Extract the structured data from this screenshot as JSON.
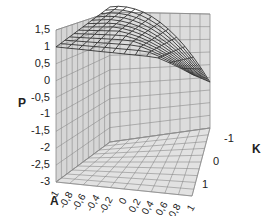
{
  "chart_data": {
    "type": "surface3d",
    "title": "",
    "zlabel": "P",
    "xlabel": "A",
    "ylabel": "K",
    "z_ticks": [
      "1,5",
      "1",
      "0,5",
      "0",
      "-0,5",
      "-1",
      "-1,5",
      "-2",
      "-2,5",
      "-3"
    ],
    "zlim": [
      -3,
      1.5
    ],
    "x_ticks": [
      "-1",
      "-0,8",
      "-0,6",
      "-0,4",
      "-0,2",
      "0",
      "0,2",
      "0,4",
      "0,6",
      "0,8",
      "1"
    ],
    "xlim": [
      -1,
      1
    ],
    "y_ticks": [
      "-1",
      "0",
      "1"
    ],
    "ylim": [
      -1,
      1
    ],
    "grid": true,
    "legend": "none",
    "surface_description": "Wireframe surface P(A,K): approximately 1 along A=-1 edge, decreasing toward about -1.8 at A=1, K=-1; near 0 to 0.5 at A=1, K=1",
    "samples": [
      {
        "A": -1,
        "K": -1,
        "P": 1.0
      },
      {
        "A": -1,
        "K": 0,
        "P": 1.0
      },
      {
        "A": -1,
        "K": 1,
        "P": 1.0
      },
      {
        "A": 0,
        "K": -1,
        "P": -0.2
      },
      {
        "A": 0,
        "K": 0,
        "P": 0.3
      },
      {
        "A": 0,
        "K": 1,
        "P": 0.6
      },
      {
        "A": 1,
        "K": -1,
        "P": -1.8
      },
      {
        "A": 1,
        "K": 0,
        "P": -0.9
      },
      {
        "A": 1,
        "K": 1,
        "P": 0.0
      }
    ]
  },
  "labels": {
    "z_axis": "P",
    "x_axis": "A",
    "y_axis": "K"
  }
}
